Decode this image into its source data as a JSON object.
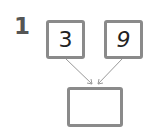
{
  "problem": {
    "number": "1",
    "inputs": [
      {
        "value": "3"
      },
      {
        "value": "9"
      }
    ],
    "result": {
      "value": ""
    }
  },
  "colors": {
    "box_border": "#8a8a8a",
    "arrow": "#999999",
    "number": "#555555"
  }
}
